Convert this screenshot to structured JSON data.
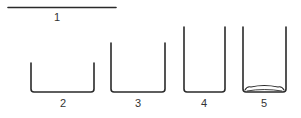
{
  "diagram": {
    "stroke_color": "#2a2a2a",
    "items": [
      {
        "id": "1",
        "label": "1",
        "kind": "flat-line"
      },
      {
        "id": "2",
        "label": "2",
        "kind": "shallow-wide-container"
      },
      {
        "id": "3",
        "label": "3",
        "kind": "medium-container"
      },
      {
        "id": "4",
        "label": "4",
        "kind": "tall-container"
      },
      {
        "id": "5",
        "label": "5",
        "kind": "tall-container-with-rim-base"
      }
    ]
  }
}
